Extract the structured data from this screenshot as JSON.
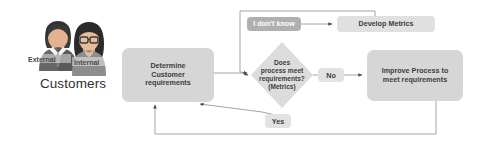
{
  "diagram": {
    "type": "flowchart",
    "background": "#ffffff",
    "palette": {
      "node_fill": "#d6d6d6",
      "node_fill_light": "#e0e0e0",
      "node_fill_dark": "#b0b0b0",
      "label_fill": "#e2e2e2",
      "text": "#3d3d3d",
      "line": "#8a8a8a"
    }
  },
  "customers": {
    "title": "Customers",
    "figures": [
      {
        "tag": "External",
        "role": "male-businessperson-icon"
      },
      {
        "tag": "Internal",
        "role": "female-businessperson-icon"
      }
    ]
  },
  "nodes": [
    {
      "id": "determine",
      "label": "Determine\nCustomer\nrequirements",
      "shape": "rounded-rect"
    },
    {
      "id": "idontknow",
      "label": "I don't know",
      "shape": "rounded-rect"
    },
    {
      "id": "develop",
      "label": "Develop Metrics",
      "shape": "rounded-rect"
    },
    {
      "id": "decision",
      "label": "Does\nprocess meet\nrequirements?\n(Metrics)",
      "shape": "diamond"
    },
    {
      "id": "improve",
      "label": "Improve Process to\nmeet requirements",
      "shape": "rounded-rect"
    }
  ],
  "edge_labels": {
    "no": "No",
    "yes": "Yes"
  },
  "edges": [
    {
      "from": "determine",
      "to": "decision",
      "label": ""
    },
    {
      "from": "idontknow",
      "to": "develop",
      "label": ""
    },
    {
      "from": "develop",
      "to": "decision",
      "label": ""
    },
    {
      "from": "decision",
      "to": "improve",
      "label": "No"
    },
    {
      "from": "decision",
      "to": "determine",
      "label": "Yes"
    },
    {
      "from": "improve",
      "to": "determine",
      "label": ""
    }
  ]
}
